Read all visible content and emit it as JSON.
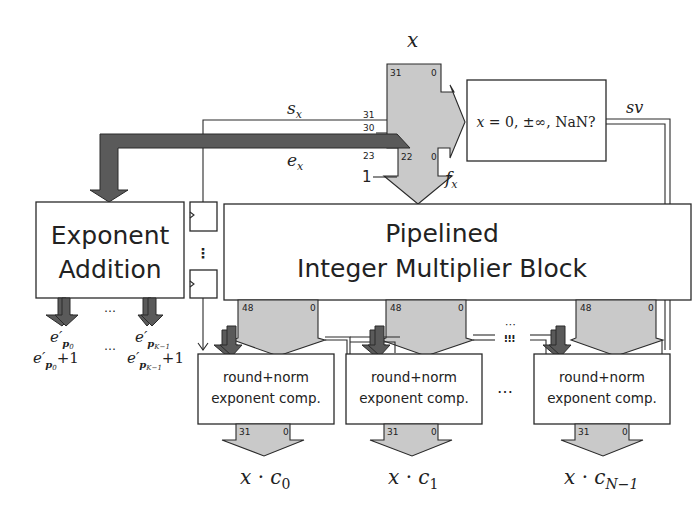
{
  "diagram": {
    "input": {
      "label": "x",
      "msb": "31",
      "lsb": "0"
    },
    "sign": {
      "label": "s_x",
      "bit": "31"
    },
    "exponent": {
      "label": "e_x",
      "bit_hi": "30",
      "bit_lo": "23"
    },
    "fraction": {
      "label": "f_x",
      "bit_hi": "22",
      "bit_lo": "0",
      "implicit_one": "1"
    },
    "special_check": {
      "label": "x = 0, ±∞, NaN?",
      "output_label": "sv"
    },
    "exponent_addition": {
      "line1": "Exponent",
      "line2": "Addition",
      "ellipsis": "…",
      "outputs": [
        {
          "label": "e′p0",
          "plus_one": "e′p0 + 1"
        },
        {
          "label": "e′pK−1",
          "plus_one": "e′pK−1 + 1"
        }
      ]
    },
    "multiplier": {
      "line1": "Pipelined",
      "line2": "Integer Multiplier Block",
      "product_msb": "48",
      "product_lsb": "0"
    },
    "registers": {
      "ellipsis": "⋮"
    },
    "round_units": [
      {
        "line1": "round+norm",
        "line2": "exponent comp.",
        "out_msb": "31",
        "out_lsb": "0",
        "output": "x · c0"
      },
      {
        "line1": "round+norm",
        "line2": "exponent comp.",
        "out_msb": "31",
        "out_lsb": "0",
        "output": "x · c1"
      },
      {
        "line1": "round+norm",
        "line2": "exponent comp.",
        "out_msb": "31",
        "out_lsb": "0",
        "output": "x · cN−1"
      }
    ],
    "between_ellipsis": "…",
    "colors": {
      "light_bus": "#c9c9c9",
      "dark_bus": "#5a5a5a",
      "stroke": "#2a2a2a"
    }
  }
}
